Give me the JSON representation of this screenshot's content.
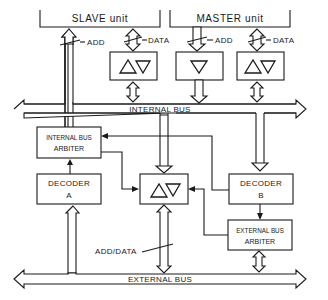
{
  "diagram": {
    "units": {
      "slave": "SLAVE unit",
      "master": "MASTER unit"
    },
    "signals": {
      "slave_add": "ADD",
      "slave_data": "DATA",
      "master_add": "ADD",
      "master_data": "DATA",
      "add_data": "ADD/DATA"
    },
    "buses": {
      "internal": "INTERNAL BUS",
      "external": "EXTERNAL BUS"
    },
    "blocks": {
      "internal_arbiter_line1": "INTERNAL BUS",
      "internal_arbiter_line2": "ARBITER",
      "decoder_a_line1": "DECODER",
      "decoder_a_line2": "A",
      "decoder_b_line1": "DECODER",
      "decoder_b_line2": "B",
      "external_arbiter_line1": "EXTERNAL BUS",
      "external_arbiter_line2": "ARBITER"
    },
    "buffers": {
      "slave_data_buffer": "bidirectional",
      "master_add_buffer": "unidirectional",
      "master_data_buffer": "bidirectional",
      "bridge_buffer": "bidirectional"
    }
  }
}
